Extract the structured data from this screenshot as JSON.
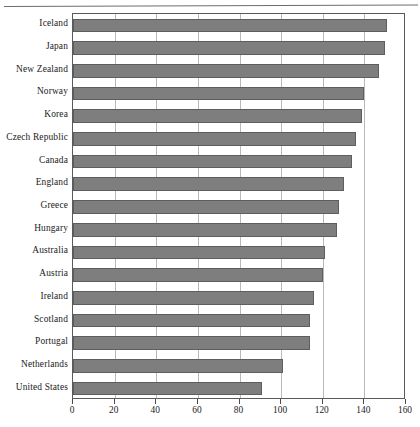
{
  "chart_data": {
    "type": "bar",
    "orientation": "horizontal",
    "title": "",
    "subtitle": "",
    "xlabel": "",
    "ylabel": "",
    "xlim": [
      0,
      160
    ],
    "ylim": null,
    "grid": "vertical",
    "legend": "none",
    "xticks": [
      0,
      20,
      40,
      60,
      80,
      100,
      120,
      140,
      160
    ],
    "xticklabels": [
      "0",
      "20",
      "40",
      "60",
      "80",
      "100",
      "120",
      "140",
      "160"
    ],
    "categories": [
      "Iceland",
      "Japan",
      "New Zealand",
      "Norway",
      "Korea",
      "Czech Republic",
      "Canada",
      "England",
      "Greece",
      "Hungary",
      "Australia",
      "Austria",
      "Ireland",
      "Scotland",
      "Portugal",
      "Netherlands",
      "United States"
    ],
    "values": [
      151,
      150,
      147,
      140,
      139,
      136,
      134,
      130,
      128,
      127,
      121,
      120,
      116,
      114,
      114,
      101,
      91
    ],
    "colors": {
      "bar_fill": "#7e7e7e",
      "bar_edge": "#5e5e5e",
      "gridline": "#b9b9b9",
      "axis": "#5a5a5a",
      "text": "#1b1b1b",
      "background": "#ffffff"
    }
  }
}
